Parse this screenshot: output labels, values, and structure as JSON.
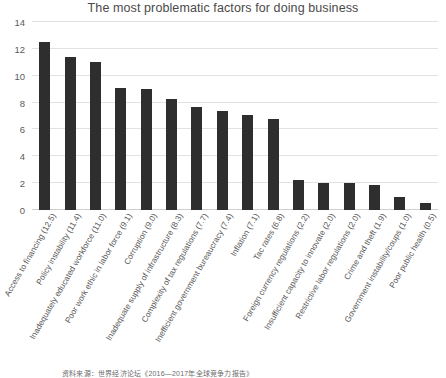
{
  "chart_data": {
    "type": "bar",
    "title": "The most problematic factors for doing business",
    "xlabel": "",
    "ylabel": "",
    "ylim": [
      0,
      14
    ],
    "yticks": [
      0,
      2,
      4,
      6,
      8,
      10,
      12,
      14
    ],
    "grid": true,
    "legend": null,
    "bar_color": "#2e2e2e",
    "categories": [
      "Access to financing  (12.5)",
      "Policy instability  (11.4)",
      "Inadequately educated workforce  (11.0)",
      "Poor work ethic in labor force  (9.1)",
      "Corruption  (9.0)",
      "Inadequate supply of infrastructure  (8.3)",
      "Complexity of tax regulations  (7.7)",
      "Inefficient government bureaucracy  (7.4)",
      "Inflation  (7.1)",
      "Tac rates  (6.8)",
      "Foreign currency regulations  (2.2)",
      "Insufficient capacity to innovate  (2.0)",
      "Restrictive labor regulations  (2.0)",
      "Crime and theft  (1.9)",
      "Government instability/coups  (1.0)",
      "Poor public health  (0.5)"
    ],
    "values": [
      12.5,
      11.4,
      11.0,
      9.1,
      9.0,
      8.3,
      7.7,
      7.4,
      7.1,
      6.8,
      2.2,
      2.0,
      2.0,
      1.9,
      1.0,
      0.5
    ]
  },
  "footer": {
    "source_note": "资料来源：世界经济论坛《2016—2017年全球竞争力报告》"
  }
}
